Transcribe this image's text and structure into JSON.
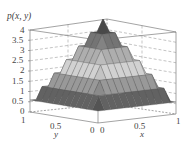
{
  "chart_data": {
    "type": "surface3d",
    "title": "",
    "zlabel": "p(x, y)",
    "xlabel": "x",
    "ylabel": "y",
    "z_ticks": [
      "0",
      "0.5",
      "1",
      "1.5",
      "2",
      "2.5",
      "3",
      "3.5",
      "4"
    ],
    "zlim": [
      0,
      4
    ],
    "x_ticks": [
      "0",
      "0.5",
      "1"
    ],
    "y_ticks": [
      "1",
      "0.5",
      "0"
    ],
    "xlim": [
      0,
      1
    ],
    "ylim": [
      0,
      1
    ],
    "grid": true,
    "colormap": "grayscale",
    "surface": {
      "description": "Pyramid-shaped joint density over the unit square, peak at center",
      "peak": {
        "x": 0.5,
        "y": 0.5,
        "z": 4
      },
      "corners": [
        {
          "x": 0,
          "y": 0,
          "z": 0
        },
        {
          "x": 1,
          "y": 0,
          "z": 0
        },
        {
          "x": 0,
          "y": 1,
          "z": 0
        },
        {
          "x": 1,
          "y": 1,
          "z": 0
        }
      ]
    }
  },
  "labels": {
    "zaxis_title": "p(x, y)",
    "ztick_0": "0",
    "ztick_05": "0.5",
    "ztick_1": "1",
    "ztick_15": "1.5",
    "ztick_2": "2",
    "ztick_25": "2.5",
    "ztick_3": "3",
    "ztick_35": "3.5",
    "ztick_4": "4",
    "ytick_1": "1",
    "ytick_05": "0.5",
    "ytick_0": "0",
    "xtick_0": "0",
    "xtick_05": "0.5",
    "xtick_1": "1",
    "xaxis_title": "x",
    "yaxis_title": "y"
  }
}
